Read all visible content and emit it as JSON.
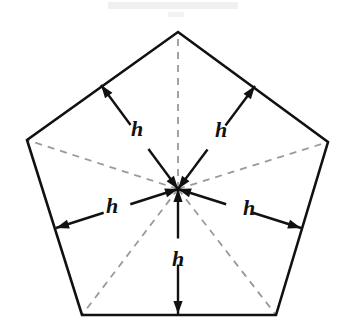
{
  "figure": {
    "kind": "geometry-diagram",
    "canvas": {
      "width": 350,
      "height": 335,
      "background": "#ffffff"
    },
    "colors": {
      "outline": "#111111",
      "arrow": "#111111",
      "dashed_radius": "#9a9a9a",
      "label": "#111111",
      "smudge": "#ededed"
    },
    "polygon": {
      "name": "regular-pentagon",
      "sides": 5,
      "stroke_width": 2.6,
      "fill": "none",
      "vertices": [
        {
          "name": "top",
          "x": 178,
          "y": 32
        },
        {
          "name": "right",
          "x": 328,
          "y": 142
        },
        {
          "name": "bottom-right",
          "x": 276,
          "y": 315
        },
        {
          "name": "bottom-left",
          "x": 82,
          "y": 315
        },
        {
          "name": "left",
          "x": 27,
          "y": 140
        }
      ],
      "points_attr": "178,32 328,142 276,315 82,315 27,140"
    },
    "center": {
      "name": "center",
      "x": 178,
      "y": 189
    },
    "radii": {
      "style": "dashed",
      "stroke_width": 1.8,
      "dash_pattern": "7 6",
      "lines": [
        {
          "name": "radius-to-top",
          "x1": 178,
          "y1": 189,
          "x2": 178,
          "y2": 32
        },
        {
          "name": "radius-to-right",
          "x1": 178,
          "y1": 189,
          "x2": 328,
          "y2": 142
        },
        {
          "name": "radius-to-bottom-right",
          "x1": 178,
          "y1": 189,
          "x2": 276,
          "y2": 315
        },
        {
          "name": "radius-to-bottom-left",
          "x1": 178,
          "y1": 189,
          "x2": 82,
          "y2": 315
        },
        {
          "name": "radius-to-left",
          "x1": 178,
          "y1": 189,
          "x2": 27,
          "y2": 140
        }
      ]
    },
    "apothems": [
      {
        "name": "apothem-upper-left",
        "label": "h",
        "from": {
          "x": 178,
          "y": 189
        },
        "to": {
          "x": 101,
          "y": 85
        },
        "label_pos": {
          "x": 137,
          "y": 129
        },
        "gap": 30
      },
      {
        "name": "apothem-upper-right",
        "label": "h",
        "from": {
          "x": 178,
          "y": 189
        },
        "to": {
          "x": 255,
          "y": 86
        },
        "label_pos": {
          "x": 221,
          "y": 130
        },
        "gap": 30
      },
      {
        "name": "apothem-left",
        "label": "h",
        "from": {
          "x": 178,
          "y": 189
        },
        "to": {
          "x": 56,
          "y": 228
        },
        "label_pos": {
          "x": 112,
          "y": 206
        },
        "gap": 28
      },
      {
        "name": "apothem-right",
        "label": "h",
        "from": {
          "x": 178,
          "y": 189
        },
        "to": {
          "x": 301,
          "y": 228
        },
        "label_pos": {
          "x": 249,
          "y": 208
        },
        "gap": 28
      },
      {
        "name": "apothem-bottom",
        "label": "h",
        "from": {
          "x": 178,
          "y": 189
        },
        "to": {
          "x": 178,
          "y": 314
        },
        "label_pos": {
          "x": 178,
          "y": 259
        },
        "gap": 26
      }
    ],
    "arrow_style": {
      "double_headed": true,
      "stroke_width": 2.4,
      "head_length": 13,
      "head_half_width": 4.6
    }
  }
}
